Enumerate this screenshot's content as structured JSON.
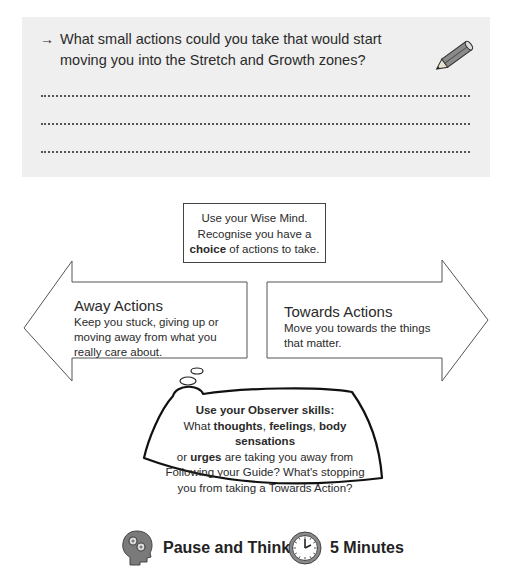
{
  "reflection": {
    "arrow_glyph": "→",
    "question": "What small actions could you take that would start moving you into the Stretch and Growth zones?",
    "icon": "pencil-icon",
    "answer_lines": 3
  },
  "wise_mind": {
    "line1": "Use your Wise Mind.",
    "line2": "Recognise you have a",
    "line3_bold": "choice",
    "line3_rest": " of actions to take."
  },
  "away_actions": {
    "title": "Away Actions",
    "description_lines": [
      "Keep you stuck, giving up or",
      "moving away from what you",
      "really care about."
    ]
  },
  "towards_actions": {
    "title": "Towards Actions",
    "description_lines": [
      "Move you towards the things",
      "that matter."
    ]
  },
  "observer_bubble": {
    "heading": "Use your Observer skills:",
    "l2_a": "What ",
    "l2_b": "thoughts",
    "l2_c": ", ",
    "l2_d": "feelings",
    "l2_e": ", ",
    "l2_f": "body sensations",
    "l3_a": "or ",
    "l3_b": "urges",
    "l3_c": " are taking you away from",
    "l4": "Following your Guide? What's stopping",
    "l5": "you from taking a Towards Action?"
  },
  "footer": {
    "pause": {
      "icon": "head-gears-icon",
      "label": "Pause and Think"
    },
    "time": {
      "icon": "clock-icon",
      "label": "5 Minutes"
    }
  },
  "colors": {
    "panel_bg": "#efefef",
    "icon_gray": "#7a7a7a",
    "outline": "#444444"
  }
}
